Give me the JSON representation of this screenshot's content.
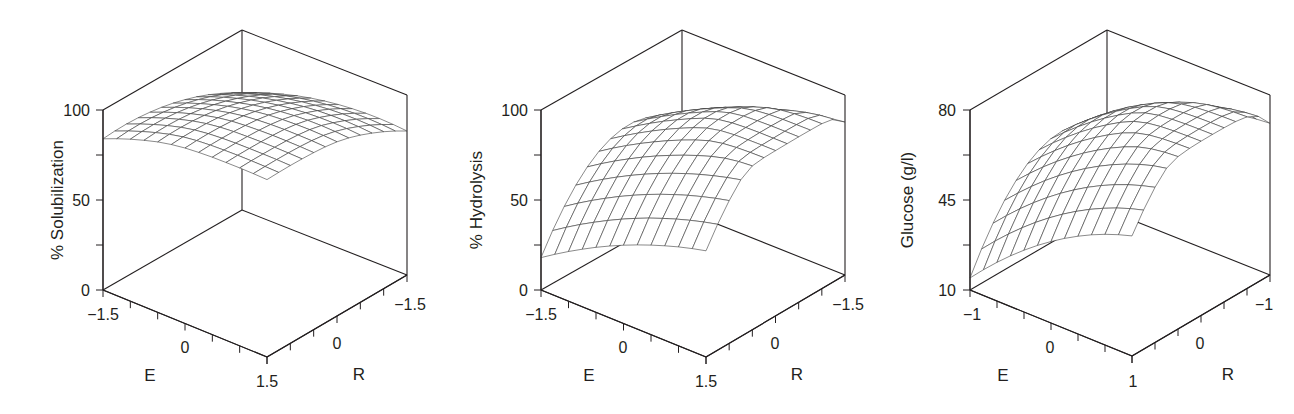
{
  "figure": {
    "panel_count": 3,
    "line_color": "#231f20",
    "mesh_color": "#3a3a3a",
    "background": "#ffffff"
  },
  "chart_data": [
    {
      "type": "surface3d",
      "title": "",
      "zlabel": "% Solubilization",
      "xlabel": "E",
      "ylabel": "R",
      "x_ticks": [
        "−1.5",
        "0",
        "1.5"
      ],
      "y_ticks": [
        "1.5",
        "0",
        "−1.5"
      ],
      "z_ticks": [
        "0",
        "50",
        "100"
      ],
      "xlim": [
        -1.5,
        1.5
      ],
      "ylim": [
        -1.5,
        1.5
      ],
      "zlim": [
        0,
        100
      ],
      "grid_n": 12,
      "surface_model": "z = a + b*u + c*v + d*u^2 + e*v^2 + f*u*v  (u=E/1.5, v=R/1.5)",
      "coefficients": {
        "a": 95,
        "b": 8,
        "c": 10,
        "d": -6,
        "e": -7,
        "f": 0
      },
      "corner_values": {
        "E-1.5_R1.5": 84,
        "E1.5_R1.5": 100,
        "E1.5_R-1.5": 80,
        "E-1.5_R-1.5": 64
      },
      "zclip": 100,
      "layout": {
        "left": [
          103,
          290
        ],
        "front": [
          267,
          357
        ],
        "right": [
          407,
          275
        ],
        "back": [
          242,
          210
        ],
        "height": 180,
        "zlabel_pos": [
          57,
          200
        ],
        "z_tick_label_x": 90,
        "x_tick_labels_pos": [
          [
            103,
            320
          ],
          [
            185,
            353
          ],
          [
            268,
            387
          ]
        ],
        "y_tick_labels_pos": [
          [
            267,
            387
          ],
          [
            337,
            349
          ],
          [
            410,
            310
          ]
        ],
        "xlabel_pos": [
          150,
          381
        ],
        "ylabel_pos": [
          359,
          380
        ]
      }
    },
    {
      "type": "surface3d",
      "title": "",
      "zlabel": "% Hydrolysis",
      "xlabel": "E",
      "ylabel": "R",
      "x_ticks": [
        "−1.5",
        "0",
        "1.5"
      ],
      "y_ticks": [
        "1.5",
        "0",
        "−1.5"
      ],
      "z_ticks": [
        "0",
        "50",
        "100"
      ],
      "xlim": [
        -1.5,
        1.5
      ],
      "ylim": [
        -1.5,
        1.5
      ],
      "zlim": [
        0,
        100
      ],
      "grid_n": 12,
      "surface_model": "z = a + b*u + c*v + d*u^2 + e*v^2 + f*u*v  (u=E/1.5, v=R/1.5)",
      "coefficients": {
        "a": 86,
        "b": 19.75,
        "c": -13.75,
        "d": -5,
        "e": -28.75,
        "f": 0.75
      },
      "corner_values": {
        "E-1.5_R1.5": 18,
        "E1.5_R1.5": 59,
        "E1.5_R-1.5": 85,
        "E-1.5_R-1.5": 47
      },
      "zclip": 92,
      "layout": {
        "left": [
          541,
          290
        ],
        "front": [
          706,
          357
        ],
        "right": [
          845,
          275
        ],
        "back": [
          682,
          210
        ],
        "height": 180,
        "zlabel_pos": [
          476,
          200
        ],
        "z_tick_label_x": 528,
        "x_tick_labels_pos": [
          [
            541,
            320
          ],
          [
            623,
            353
          ],
          [
            706,
            387
          ]
        ],
        "y_tick_labels_pos": [
          [
            706,
            387
          ],
          [
            775,
            349
          ],
          [
            848,
            310
          ]
        ],
        "xlabel_pos": [
          589,
          381
        ],
        "ylabel_pos": [
          797,
          380
        ]
      }
    },
    {
      "type": "surface3d",
      "title": "",
      "zlabel": "Glucose (g/l)",
      "xlabel": "E",
      "ylabel": "R",
      "x_ticks": [
        "−1",
        "0",
        "1"
      ],
      "y_ticks": [
        "1",
        "0",
        "−1"
      ],
      "z_ticks": [
        "10",
        "45",
        "80"
      ],
      "xlim": [
        -1,
        1
      ],
      "ylim": [
        -1,
        1
      ],
      "zlim": [
        10,
        80
      ],
      "grid_n": 12,
      "surface_model": "z = a + b*u + c*v + d*u^2 + e*v^2 + f*u*v  (u=E, v=R)",
      "coefficients": {
        "a": 72.25,
        "b": 17.5,
        "c": -9.65,
        "d": -6,
        "e": -20.9,
        "f": 3.5
      },
      "corner_values": {
        "E-1_R1": 14.7,
        "E1_R1": 56.7,
        "E1_R-1": 69,
        "E-1_R-1": 41
      },
      "zclip": 78,
      "layout": {
        "left": [
          970,
          290
        ],
        "front": [
          1132,
          356
        ],
        "right": [
          1270,
          275
        ],
        "back": [
          1107,
          210
        ],
        "height": 180,
        "zlabel_pos": [
          907,
          200
        ],
        "z_tick_label_x": 956,
        "x_tick_labels_pos": [
          [
            972,
            320
          ],
          [
            1050,
            353
          ],
          [
            1133,
            387
          ]
        ],
        "y_tick_labels_pos": [
          [
            1133,
            387
          ],
          [
            1200,
            349
          ],
          [
            1264,
            310
          ]
        ],
        "xlabel_pos": [
          1003,
          381
        ],
        "ylabel_pos": [
          1228,
          380
        ]
      }
    }
  ]
}
